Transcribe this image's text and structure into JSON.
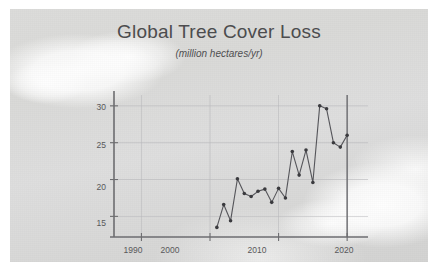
{
  "chart_data": {
    "type": "line",
    "title": "Global Tree Cover Loss",
    "subtitle": "(million hectares/yr)",
    "xlabel": "",
    "ylabel": "",
    "xlim": [
      1986,
      2021
    ],
    "ylim": [
      12.2,
      31.2
    ],
    "xticks": [
      1990,
      2000,
      2010,
      2020
    ],
    "yticks": [
      15,
      20,
      25,
      30
    ],
    "grid": true,
    "legend": "none",
    "markers": true,
    "line_color": "#55555a",
    "marker_color": "#3a3a3e",
    "grid_color": "#b9b9bb",
    "axis_color": "#6d6d70",
    "x": [
      2001,
      2002,
      2003,
      2004,
      2005,
      2006,
      2007,
      2008,
      2009,
      2010,
      2011,
      2012,
      2013,
      2014,
      2015,
      2016,
      2017,
      2018,
      2019,
      2020
    ],
    "values": [
      13.5,
      16.6,
      14.4,
      20.1,
      18.1,
      17.7,
      18.4,
      18.7,
      16.9,
      18.8,
      17.5,
      23.8,
      20.6,
      24.0,
      19.6,
      30.0,
      29.6,
      25.0,
      24.4,
      26.0
    ]
  },
  "axis": {
    "ytick_labels": [
      "30",
      "25",
      "20",
      "15"
    ],
    "xtick_labels": [
      "1990",
      "2000",
      "2010",
      "2020"
    ]
  }
}
